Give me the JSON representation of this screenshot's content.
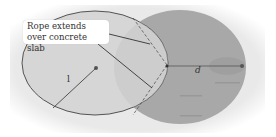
{
  "figure": {
    "callout_text_line1": "Rope extends",
    "callout_text_line2": "over concrete slab",
    "label_radius": "l",
    "label_distance": "d"
  },
  "colors": {
    "background": "#ffffff",
    "grass_circle": "#d6d6d6",
    "slab": "#a9a9a9",
    "outline": "#444444"
  }
}
